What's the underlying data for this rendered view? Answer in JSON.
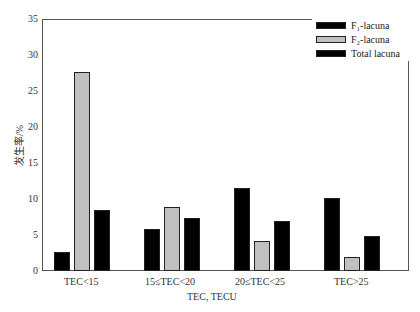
{
  "chart_data": {
    "type": "bar",
    "categories": [
      "TEC<15",
      "15≤TEC<20",
      "20≤TEC<25",
      "TEC>25"
    ],
    "series": [
      {
        "name": "F1-lacuna",
        "color": "#000000",
        "values": [
          2.6,
          5.8,
          11.5,
          10.1
        ]
      },
      {
        "name": "F2-lacuna",
        "color": "#c0c0c0",
        "values": [
          27.7,
          8.9,
          4.2,
          2.0
        ]
      },
      {
        "name": "Total lacuna",
        "color": "#000000",
        "values": [
          8.5,
          7.3,
          6.9,
          4.8
        ]
      }
    ],
    "xlabel": "TEC, TECU",
    "ylabel": "发生率/%",
    "ylim": [
      0,
      35
    ],
    "yticks": [
      0,
      5,
      10,
      15,
      20,
      25,
      30,
      35
    ],
    "legend_position": "upper right",
    "grid": false
  },
  "legend": {
    "f1": "F₁-lacuna",
    "f2": "F₂-lacuna",
    "total": "Total lacuna"
  },
  "axis": {
    "xlabel": "TEC, TECU",
    "ylabel": "发生率/%"
  }
}
